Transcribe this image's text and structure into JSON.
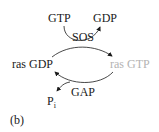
{
  "diagram": {
    "nodes": {
      "gtp": "GTP",
      "gdp": "GDP",
      "sos": "SOS",
      "ras_gdp": "ras GDP",
      "ras_gtp": "ras GTP",
      "gap": "GAP",
      "pi_main": "P",
      "pi_sub": "i"
    },
    "panel_label": "(b)",
    "colors": {
      "text": "#1a1a1a",
      "ras_gtp": "#b3b3b3",
      "arrow": "#1a1a1a"
    }
  }
}
